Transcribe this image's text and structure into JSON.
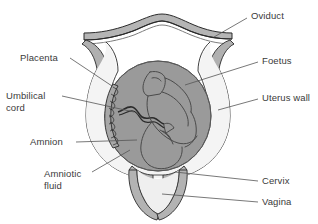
{
  "diagram": {
    "type": "anatomical-cross-section",
    "background_color": "#ffffff",
    "stroke_color": "#2b2b2b",
    "palette": {
      "fundus_band": "#b5b5b5",
      "uterus_wall": "#b0b0b0",
      "uterus_cavity": "#f2f2f2",
      "amniotic_sac": "#9a9a9a",
      "foetus_outline": "#4a4a4a",
      "vagina_wall": "#b3b3b3",
      "vagina_lumen": "#efefef",
      "label_text": "#3a3a3a",
      "leader_line": "#555555"
    },
    "labels": [
      {
        "id": "oviduct",
        "text": "Oviduct",
        "side": "right",
        "x": 251,
        "y": 10,
        "leader": [
          [
            247,
            18
          ],
          [
            214,
            37
          ]
        ]
      },
      {
        "id": "placenta",
        "text": "Placenta",
        "side": "left",
        "x": 20,
        "y": 52,
        "leader": [
          [
            70,
            58
          ],
          [
            112,
            86
          ]
        ]
      },
      {
        "id": "foetus",
        "text": "Foetus",
        "side": "right",
        "x": 262,
        "y": 55,
        "leader": [
          [
            258,
            62
          ],
          [
            185,
            85
          ]
        ]
      },
      {
        "id": "umbilical-cord",
        "text": "Umbilical\ncord",
        "line1": "Umbilical",
        "line2": "cord",
        "side": "left",
        "x": 6,
        "y": 90,
        "leader": [
          [
            62,
            96
          ],
          [
            134,
            112
          ]
        ]
      },
      {
        "id": "uterus-wall",
        "text": "Uterus wall",
        "side": "right",
        "x": 262,
        "y": 92,
        "leader": [
          [
            258,
            99
          ],
          [
            218,
            110
          ]
        ]
      },
      {
        "id": "amnion",
        "text": "Amnion",
        "side": "left",
        "x": 30,
        "y": 136,
        "leader": [
          [
            76,
            142
          ],
          [
            137,
            140
          ]
        ]
      },
      {
        "id": "amniotic-fluid",
        "text": "Amniotic\nfluid",
        "line1": "Amniotic",
        "line2": "fluid",
        "side": "left",
        "x": 44,
        "y": 168,
        "leader": [
          [
            92,
            172
          ],
          [
            130,
            150
          ]
        ]
      },
      {
        "id": "cervix",
        "text": "Cervix",
        "side": "right",
        "x": 262,
        "y": 175,
        "leader": [
          [
            258,
            181
          ],
          [
            175,
            172
          ]
        ]
      },
      {
        "id": "vagina",
        "text": "Vagina",
        "side": "right",
        "x": 262,
        "y": 196,
        "leader": [
          [
            258,
            202
          ],
          [
            162,
            194
          ]
        ]
      }
    ],
    "structures": [
      {
        "id": "fundus-band",
        "name": "Oviduct / fundus band"
      },
      {
        "id": "uterus-wall",
        "name": "Uterus wall"
      },
      {
        "id": "uterus-cavity",
        "name": "Uterine cavity"
      },
      {
        "id": "amniotic-sac",
        "name": "Amnion and amniotic fluid"
      },
      {
        "id": "placenta",
        "name": "Placenta"
      },
      {
        "id": "umbilical-cord",
        "name": "Umbilical cord"
      },
      {
        "id": "foetus",
        "name": "Foetus"
      },
      {
        "id": "cervix",
        "name": "Cervix"
      },
      {
        "id": "vagina",
        "name": "Vagina"
      }
    ]
  }
}
